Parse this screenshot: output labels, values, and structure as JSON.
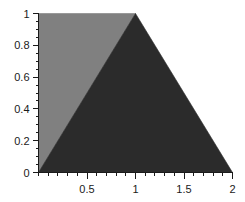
{
  "chart_data": {
    "type": "area",
    "title": "",
    "subtitle": "",
    "xlabel": "",
    "ylabel": "",
    "xlim": [
      0,
      2
    ],
    "ylim": [
      0,
      1
    ],
    "grid": false,
    "legend": null,
    "background_color": "#ffffff",
    "axis_color": "#1a1a1a",
    "x_ticks_major": [
      0.5,
      1,
      1.5,
      2
    ],
    "x_tick_labels": [
      "0.5",
      "1",
      "1.5",
      "2"
    ],
    "x_tick_minor_step": 0.1,
    "y_ticks_major": [
      0,
      0.2,
      0.4,
      0.6,
      0.8,
      1
    ],
    "y_tick_labels": [
      "0",
      "0.2",
      "0.4",
      "0.6",
      "0.8",
      "1"
    ],
    "y_tick_minor_step": 0.05,
    "series": [
      {
        "name": "light-region",
        "color": "#808080",
        "shape": "polygon",
        "points": [
          [
            0,
            0
          ],
          [
            0,
            1
          ],
          [
            1,
            1
          ]
        ]
      },
      {
        "name": "dark-region",
        "color": "#2b2b2b",
        "shape": "polygon",
        "points": [
          [
            0,
            0
          ],
          [
            1,
            1
          ],
          [
            2,
            0
          ]
        ]
      }
    ]
  }
}
